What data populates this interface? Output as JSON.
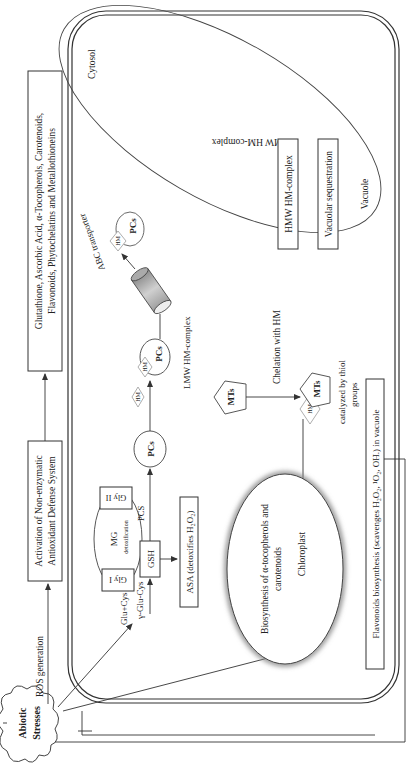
{
  "diagram": {
    "stress": {
      "line1": "Abiotic",
      "line2": "Stresses"
    },
    "ros_generation": "ROS generation",
    "activation_box": {
      "line1": "Activation of Non-enzymatic",
      "line2": "Antioxidant Defense System"
    },
    "antioxidants_box": {
      "line1": "Glutathione, Ascorbic Acid, α-Tocopherols, Carotenoids,",
      "line2": "Flavonoids, Phytochelatins and Metallothioneins"
    },
    "cytosol": "Cytosol",
    "glu_cys": "Glu+Cys",
    "gamma_glu_cys": "γ-Glu-Cys",
    "gsh": "GSH",
    "mg": {
      "label": "MG",
      "sub": "detoxification",
      "gly1": "Gly I",
      "gly2": "Gly II"
    },
    "pcs_enzyme": "PCS",
    "asa_box": "ASA (detoxifies H₂O₂)",
    "pcs": "PCs",
    "hm": "HM",
    "mts": "MTs",
    "lmw_complex_cytosol": "LMW HM-complex",
    "abc_transporter": "ABC transporter",
    "chelation": "Chelation with HM",
    "catalyzed": {
      "line1": "catalyzed by thiol",
      "line2": "groups"
    },
    "chloroplast": {
      "line1": "Biosynthesis of α-tocopherols and",
      "line2": "carotenoids",
      "name": "Chloroplast"
    },
    "vacuole": {
      "lmw": "LMW HM-complex",
      "hmw": "HMW HM-complex",
      "sequestration": "Vacuolar sequestration",
      "name": "Vacuole"
    },
    "flavonoids_box": "Flavonoids biosynthesis (scavenges H₂O₂, ¹O₂, OH.) in vacuole"
  }
}
